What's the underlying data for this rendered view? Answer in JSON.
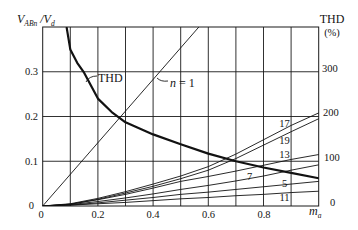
{
  "chart_data": {
    "type": "line",
    "title": "",
    "xlabel": "m_a",
    "ylabel": "V_ABn / V_d",
    "y2label": "THD (%)",
    "xlim": [
      0,
      1.0
    ],
    "ylim": [
      0,
      0.4
    ],
    "y2lim": [
      0,
      400
    ],
    "grid": true,
    "grid_x_step": 0.1,
    "grid_y_step": 0.1,
    "legend": "inline labels",
    "x_tick_labels": [
      "0",
      "0.2",
      "0.4",
      "0.6",
      "0.8"
    ],
    "y_tick_labels": [
      "0",
      "0.1",
      "0.2",
      "0.3"
    ],
    "y2_tick_labels": [
      "0",
      "100",
      "200",
      "300"
    ],
    "series": [
      {
        "name": "n = 1",
        "axis": "left",
        "line_width": 0.9,
        "x": [
          0,
          1.0
        ],
        "values": [
          0,
          0.707
        ]
      },
      {
        "name": "17",
        "axis": "left",
        "line_width": 0.9,
        "x": [
          0,
          0.1,
          0.2,
          0.3,
          0.4,
          0.5,
          0.6,
          0.7,
          0.8,
          0.9,
          1.0
        ],
        "values": [
          0,
          0.005,
          0.017,
          0.032,
          0.049,
          0.067,
          0.088,
          0.116,
          0.148,
          0.18,
          0.208
        ]
      },
      {
        "name": "19",
        "axis": "left",
        "line_width": 0.9,
        "x": [
          0,
          0.1,
          0.2,
          0.3,
          0.4,
          0.5,
          0.6,
          0.7,
          0.8,
          0.9,
          1.0
        ],
        "values": [
          0,
          0.004,
          0.015,
          0.029,
          0.044,
          0.061,
          0.08,
          0.106,
          0.136,
          0.166,
          0.195
        ]
      },
      {
        "name": "13",
        "axis": "left",
        "line_width": 0.9,
        "x": [
          0,
          0.1,
          0.2,
          0.3,
          0.4,
          0.5,
          0.6,
          0.7,
          0.8,
          0.9,
          1.0
        ],
        "values": [
          0,
          0.004,
          0.014,
          0.026,
          0.04,
          0.055,
          0.066,
          0.078,
          0.091,
          0.104,
          0.115
        ]
      },
      {
        "name": "7",
        "axis": "left",
        "line_width": 0.9,
        "x": [
          0,
          0.1,
          0.2,
          0.3,
          0.4,
          0.5,
          0.6,
          0.7,
          0.8,
          0.9,
          1.0
        ],
        "values": [
          0,
          0.003,
          0.01,
          0.018,
          0.027,
          0.037,
          0.046,
          0.056,
          0.067,
          0.08,
          0.092
        ]
      },
      {
        "name": "5",
        "axis": "left",
        "line_width": 0.9,
        "x": [
          0,
          0.1,
          0.2,
          0.3,
          0.4,
          0.5,
          0.6,
          0.7,
          0.8,
          0.9,
          1.0
        ],
        "values": [
          0,
          0.002,
          0.007,
          0.013,
          0.019,
          0.026,
          0.031,
          0.037,
          0.043,
          0.049,
          0.055
        ]
      },
      {
        "name": "11",
        "axis": "left",
        "line_width": 0.9,
        "x": [
          0,
          0.1,
          0.2,
          0.3,
          0.4,
          0.5,
          0.6,
          0.7,
          0.8,
          0.9,
          1.0
        ],
        "values": [
          0,
          0.002,
          0.005,
          0.008,
          0.012,
          0.016,
          0.019,
          0.023,
          0.026,
          0.03,
          0.033
        ]
      },
      {
        "name": "THD",
        "axis": "right",
        "line_width": 2.2,
        "x": [
          0.087,
          0.1,
          0.125,
          0.15,
          0.2,
          0.25,
          0.3,
          0.4,
          0.5,
          0.6,
          0.7,
          0.8,
          0.9,
          1.0
        ],
        "values": [
          398,
          350,
          320,
          298,
          240,
          210,
          187,
          160,
          138,
          117,
          100,
          86,
          74,
          62
        ]
      }
    ]
  },
  "labels": {
    "y_title": {
      "v": "V",
      "v_sub": "ABn",
      "slash_v": " /V",
      "d_sub": "d"
    },
    "y2_title": {
      "line1": "THD",
      "line2": "(%)"
    },
    "x_title": {
      "m": "m",
      "m_sub": "a"
    },
    "thd_curve": "THD",
    "n1_symbol": "n",
    "n1_value": " = 1",
    "harmonics": {
      "h17": "17",
      "h19": "19",
      "h13": "13",
      "h7": "7",
      "h5": "5",
      "h11": "11"
    }
  }
}
